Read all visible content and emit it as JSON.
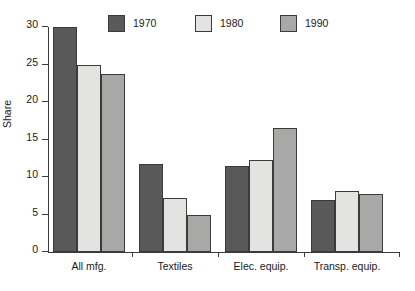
{
  "chart_data": {
    "type": "bar",
    "title": "",
    "subtitle": "",
    "xlabel": "",
    "ylabel": "Share",
    "ylim": [
      0,
      30
    ],
    "yticks": [
      0,
      5,
      10,
      15,
      20,
      25,
      30
    ],
    "grid": false,
    "legend_position": "top",
    "categories": [
      "All mfg.",
      "Textiles",
      "Elec. equip.",
      "Transp. equip."
    ],
    "series": [
      {
        "name": "1970",
        "color": "#595959",
        "values": [
          30.0,
          11.7,
          11.5,
          7.0
        ]
      },
      {
        "name": "1980",
        "color": "#e3e3e1",
        "values": [
          25.0,
          7.2,
          12.3,
          8.2
        ]
      },
      {
        "name": "1990",
        "color": "#a8a8a6",
        "values": [
          23.8,
          5.0,
          16.6,
          7.7
        ]
      }
    ]
  },
  "legend": {
    "items": [
      {
        "label": "1970",
        "color": "#595959"
      },
      {
        "label": "1980",
        "color": "#e3e3e1"
      },
      {
        "label": "1990",
        "color": "#a8a8a6"
      }
    ]
  },
  "axes": {
    "y_label": "Share",
    "y_tick_labels": [
      "0",
      "5",
      "10",
      "15",
      "20",
      "25",
      "30"
    ],
    "x_tick_labels": [
      "All mfg.",
      "Textiles",
      "Elec. equip.",
      "Transp. equip."
    ]
  },
  "colors": {
    "axis": "#3b3b3b",
    "bar_outline": "#3b3b3b",
    "background": "#ffffff",
    "text": "#1a1a1a"
  }
}
